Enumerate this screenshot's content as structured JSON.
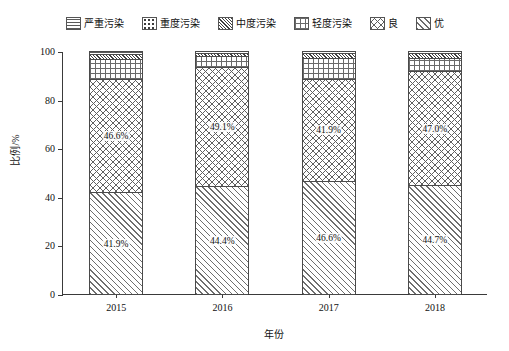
{
  "chart_data": {
    "type": "bar",
    "stacked": true,
    "title": "",
    "xlabel": "年份",
    "ylabel": "比例/%",
    "categories": [
      "2015",
      "2016",
      "2017",
      "2018"
    ],
    "ylim": [
      0,
      100
    ],
    "yticks": [
      0,
      20,
      40,
      60,
      80,
      100
    ],
    "ytick_labels": [
      "0",
      "20",
      "40",
      "60",
      "80",
      "100"
    ],
    "grid": false,
    "legend_position": "top",
    "series": [
      {
        "name": "优",
        "pattern": "diagonal-hatch",
        "values": [
          41.9,
          44.4,
          46.6,
          44.7
        ],
        "labels": [
          "41.9%",
          "44.4%",
          "46.6%",
          "44.7%"
        ]
      },
      {
        "name": "良",
        "pattern": "cross-hatch",
        "values": [
          46.6,
          49.1,
          41.9,
          47.0
        ],
        "labels": [
          "46.6%",
          "49.1%",
          "41.9%",
          "47.0%"
        ]
      },
      {
        "name": "轻度污染",
        "pattern": "square-grid",
        "values": [
          8.2,
          4.4,
          8.5,
          5.5
        ],
        "labels": [
          "",
          "",
          "",
          ""
        ]
      },
      {
        "name": "中度污染",
        "pattern": "dense-diagonal",
        "values": [
          2.2,
          1.4,
          2.2,
          2.0
        ],
        "labels": [
          "",
          "",
          "",
          ""
        ]
      },
      {
        "name": "重度污染",
        "pattern": "dots",
        "values": [
          0.8,
          0.5,
          0.6,
          0.6
        ],
        "labels": [
          "",
          "",
          "",
          ""
        ]
      },
      {
        "name": "严重污染",
        "pattern": "horizontal-lines",
        "values": [
          0.3,
          0.2,
          0.2,
          0.2
        ],
        "labels": [
          "",
          "",
          "",
          ""
        ]
      }
    ]
  },
  "legend": {
    "items": [
      {
        "label": "严重污染",
        "pattern": "horizontal-lines"
      },
      {
        "label": "重度污染",
        "pattern": "dots"
      },
      {
        "label": "中度污染",
        "pattern": "dense-diagonal"
      },
      {
        "label": "轻度污染",
        "pattern": "square-grid"
      },
      {
        "label": "良",
        "pattern": "cross-hatch"
      },
      {
        "label": "优",
        "pattern": "diagonal-hatch"
      }
    ]
  },
  "axes": {
    "y_title": "比例/%",
    "x_title": "年份",
    "y_tick_labels": [
      "100",
      "80",
      "60",
      "40",
      "20",
      "0"
    ],
    "x_tick_labels": [
      "2015",
      "2016",
      "2017",
      "2018"
    ]
  }
}
